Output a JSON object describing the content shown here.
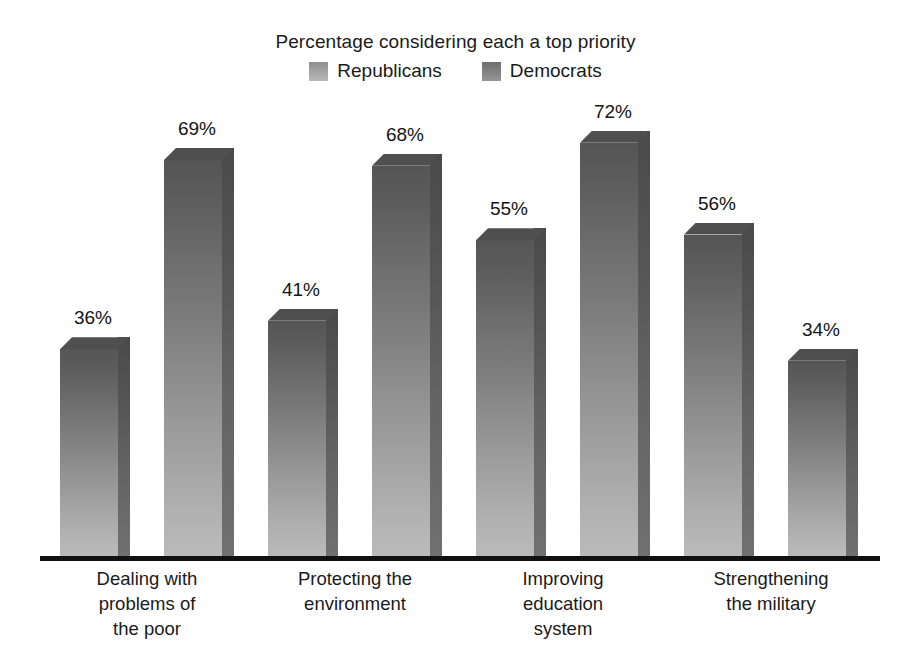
{
  "chart_data": {
    "type": "bar",
    "title": "Percentage considering each a top priority",
    "xlabel": "",
    "ylabel": "",
    "ylim": [
      0,
      80
    ],
    "grid": false,
    "legend_position": "top-center",
    "value_suffix": "%",
    "categories": [
      "Dealing with problems of the poor",
      "Protecting the environment",
      "Improving education system",
      "Strengthening the military"
    ],
    "category_lines": [
      [
        "Dealing with",
        "problems of",
        "the poor"
      ],
      [
        "Protecting the",
        "environment"
      ],
      [
        "Improving",
        "education",
        "system"
      ],
      [
        "Strengthening",
        "the military"
      ]
    ],
    "series": [
      {
        "name": "Republicans",
        "color": "#a3a3a3",
        "values": [
          36,
          41,
          55,
          56
        ],
        "labels": [
          "36%",
          "41%",
          "55%",
          "56%"
        ]
      },
      {
        "name": "Democrats",
        "color": "#838383",
        "values": [
          69,
          68,
          72,
          34
        ],
        "labels": [
          "69%",
          "68%",
          "72%",
          "34%"
        ]
      }
    ]
  },
  "legend": {
    "entries": [
      {
        "label": "Republicans",
        "swatch": "republicans-swatch"
      },
      {
        "label": "Democrats",
        "swatch": "democrats-swatch"
      }
    ]
  },
  "colors": {
    "background": "#ffffff",
    "axis": "#111111",
    "text": "#1a1a1a",
    "bar_front_top": "#555555",
    "bar_front_bottom": "#bababa",
    "bar_side": "#555555",
    "bar_top": "#4f4f4f"
  },
  "geometry": {
    "baseline_y": 556,
    "px_per_percent": 5.74,
    "bar_width": 58,
    "depth": 12,
    "bar_left_positions": [
      60,
      164,
      268,
      372,
      476,
      580,
      684,
      788
    ]
  }
}
